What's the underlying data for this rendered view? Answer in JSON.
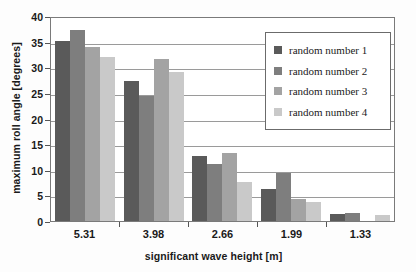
{
  "chart_data": {
    "type": "bar",
    "title": "",
    "xlabel": "significant wave height [m]",
    "ylabel": "maximum roll angle [degrees]",
    "categories": [
      "5.31",
      "3.98",
      "2.66",
      "1.99",
      "1.33"
    ],
    "series": [
      {
        "name": "random number 1",
        "color": "#5a5a5a",
        "values": [
          35.2,
          27.3,
          12.6,
          6.3,
          1.3
        ]
      },
      {
        "name": "random number 2",
        "color": "#7e7e7e",
        "values": [
          37.2,
          24.4,
          11.2,
          9.3,
          1.5
        ]
      },
      {
        "name": "random number 3",
        "color": "#a3a3a3",
        "values": [
          34.0,
          31.7,
          13.3,
          4.2,
          0.0
        ]
      },
      {
        "name": "random number 4",
        "color": "#c9c9c9",
        "values": [
          32.0,
          29.1,
          7.6,
          3.8,
          1.2
        ]
      }
    ],
    "ylim": [
      0,
      40
    ],
    "yticks": [
      "0",
      "5",
      "10",
      "15",
      "20",
      "25",
      "30",
      "35",
      "40"
    ],
    "ytick_values": [
      0,
      5,
      10,
      15,
      20,
      25,
      30,
      35,
      40
    ],
    "grid": true,
    "legend_position": "upper right",
    "axis_color": "#7a7a7a",
    "grid_color": "#9a9a9a"
  }
}
